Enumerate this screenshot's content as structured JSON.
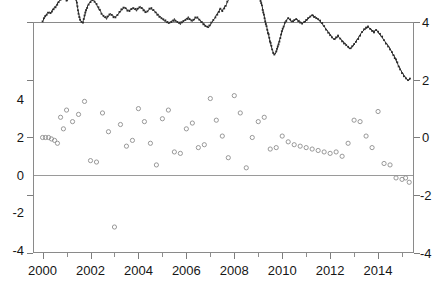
{
  "title": "",
  "chart_data": {
    "type": "line",
    "title": "",
    "xlabel": "",
    "ylabel_left": "",
    "ylabel_right": "",
    "xlim": [
      1999.6,
      2015.5
    ],
    "ylim_left": [
      -4,
      4
    ],
    "ylim_right": [
      -4,
      4
    ],
    "xticks": [
      2000,
      2002,
      2004,
      2006,
      2008,
      2010,
      2012,
      2014
    ],
    "xticklabels": [
      "2000",
      "2002",
      "2004",
      "2006",
      "2008",
      "2010",
      "2012",
      "2014"
    ],
    "xticks_minor": [
      2001,
      2003,
      2005,
      2007,
      2009,
      2011,
      2013,
      2015
    ],
    "yticks_left": [
      -4,
      -2,
      0,
      2,
      4
    ],
    "yticklabels_left": [
      "-4",
      "-2",
      "0",
      "2",
      "4"
    ],
    "yticks_right": [
      -4,
      -2,
      0,
      2,
      4
    ],
    "yticklabels_right": [
      "-4",
      "-2",
      "0",
      "2",
      "4"
    ],
    "right_axis_offset": 4,
    "grid": false,
    "legend": "none",
    "reference_line_y": 0,
    "series": [
      {
        "name": "index-line",
        "axis": "right",
        "style": "dense-dotted-line",
        "color": "#2b2b2b",
        "x": [
          2000.0,
          2000.08,
          2000.17,
          2000.25,
          2000.33,
          2000.42,
          2000.5,
          2000.58,
          2000.67,
          2000.75,
          2000.83,
          2000.92,
          2001.0,
          2001.08,
          2001.17,
          2001.25,
          2001.33,
          2001.42,
          2001.5,
          2001.58,
          2001.67,
          2001.75,
          2001.83,
          2001.92,
          2002.0,
          2002.08,
          2002.17,
          2002.25,
          2002.33,
          2002.42,
          2002.5,
          2002.58,
          2002.67,
          2002.75,
          2002.83,
          2002.92,
          2003.0,
          2003.08,
          2003.17,
          2003.25,
          2003.33,
          2003.42,
          2003.5,
          2003.58,
          2003.67,
          2003.75,
          2003.83,
          2003.92,
          2004.0,
          2004.08,
          2004.17,
          2004.25,
          2004.33,
          2004.42,
          2004.5,
          2004.58,
          2004.67,
          2004.75,
          2004.83,
          2004.92,
          2005.0,
          2005.08,
          2005.17,
          2005.25,
          2005.33,
          2005.42,
          2005.5,
          2005.58,
          2005.67,
          2005.75,
          2005.83,
          2005.92,
          2006.0,
          2006.08,
          2006.17,
          2006.25,
          2006.33,
          2006.42,
          2006.5,
          2006.58,
          2006.67,
          2006.75,
          2006.83,
          2006.92,
          2007.0,
          2007.08,
          2007.17,
          2007.25,
          2007.33,
          2007.42,
          2007.5,
          2007.58,
          2007.67,
          2007.75,
          2007.83,
          2007.92,
          2008.0,
          2008.08,
          2008.17,
          2008.25,
          2008.33,
          2008.42,
          2008.5,
          2008.58,
          2008.67,
          2008.75,
          2008.83,
          2008.92,
          2009.0,
          2009.08,
          2009.17,
          2009.25,
          2009.33,
          2009.42,
          2009.5,
          2009.58,
          2009.67,
          2009.75,
          2009.83,
          2009.92,
          2010.0,
          2010.08,
          2010.17,
          2010.25,
          2010.33,
          2010.42,
          2010.5,
          2010.58,
          2010.67,
          2010.75,
          2010.83,
          2010.92,
          2011.0,
          2011.08,
          2011.17,
          2011.25,
          2011.33,
          2011.42,
          2011.5,
          2011.58,
          2011.67,
          2011.75,
          2011.83,
          2011.92,
          2012.0,
          2012.08,
          2012.17,
          2012.25,
          2012.33,
          2012.42,
          2012.5,
          2012.58,
          2012.67,
          2012.75,
          2012.83,
          2012.92,
          2013.0,
          2013.08,
          2013.17,
          2013.25,
          2013.33,
          2013.42,
          2013.5,
          2013.58,
          2013.67,
          2013.75,
          2013.83,
          2013.92,
          2014.0,
          2014.08,
          2014.17,
          2014.25,
          2014.33,
          2014.42,
          2014.5,
          2014.58,
          2014.67,
          2014.75,
          2014.83,
          2014.92,
          2015.0,
          2015.08,
          2015.17,
          2015.25,
          2015.33
        ],
        "values": [
          0.02,
          0.15,
          0.28,
          0.34,
          0.3,
          0.42,
          0.5,
          0.58,
          0.7,
          0.8,
          0.88,
          0.8,
          0.72,
          0.78,
          0.84,
          0.9,
          0.95,
          0.7,
          0.3,
          0.05,
          -0.05,
          0.2,
          0.45,
          0.62,
          0.72,
          0.78,
          0.7,
          0.6,
          0.48,
          0.36,
          0.26,
          0.18,
          0.12,
          0.2,
          0.28,
          0.22,
          0.16,
          0.22,
          0.3,
          0.38,
          0.44,
          0.5,
          0.44,
          0.38,
          0.44,
          0.5,
          0.46,
          0.4,
          0.46,
          0.52,
          0.46,
          0.4,
          0.34,
          0.42,
          0.48,
          0.42,
          0.36,
          0.3,
          0.24,
          0.18,
          0.12,
          0.06,
          0.0,
          -0.06,
          -0.02,
          0.04,
          0.1,
          0.04,
          -0.02,
          -0.06,
          -0.02,
          0.04,
          0.1,
          0.16,
          0.1,
          0.04,
          0.1,
          0.16,
          0.1,
          0.04,
          -0.02,
          -0.08,
          -0.14,
          -0.18,
          -0.1,
          0.0,
          0.1,
          0.22,
          0.34,
          0.46,
          0.4,
          0.5,
          0.62,
          0.74,
          0.86,
          0.8,
          0.92,
          1.04,
          1.16,
          1.3,
          1.46,
          1.62,
          1.78,
          1.92,
          2.0,
          1.86,
          1.66,
          1.4,
          1.1,
          0.8,
          0.5,
          0.2,
          -0.1,
          -0.4,
          -0.7,
          -0.95,
          -1.15,
          -1.05,
          -0.8,
          -0.55,
          -0.3,
          -0.1,
          0.05,
          0.12,
          0.06,
          0.0,
          0.06,
          0.12,
          0.06,
          0.0,
          -0.06,
          -0.02,
          0.04,
          0.12,
          0.2,
          0.26,
          0.2,
          0.14,
          0.08,
          0.02,
          -0.06,
          -0.14,
          -0.24,
          -0.34,
          -0.44,
          -0.54,
          -0.62,
          -0.56,
          -0.48,
          -0.56,
          -0.64,
          -0.72,
          -0.8,
          -0.88,
          -0.94,
          -0.86,
          -0.76,
          -0.66,
          -0.56,
          -0.46,
          -0.36,
          -0.28,
          -0.22,
          -0.16,
          -0.22,
          -0.28,
          -0.34,
          -0.28,
          -0.36,
          -0.44,
          -0.52,
          -0.62,
          -0.72,
          -0.82,
          -0.94,
          -1.06,
          -1.18,
          -1.32,
          -1.48,
          -1.62,
          -1.74,
          -1.86,
          -1.96,
          -2.04,
          -1.96
        ]
      },
      {
        "name": "residual-scatter",
        "axis": "left",
        "style": "open-circles",
        "color": "#8d8d8d",
        "x": [
          2000.0,
          2000.12,
          2000.25,
          2000.37,
          2000.5,
          2000.62,
          2000.75,
          2000.87,
          2001.0,
          2001.25,
          2001.5,
          2001.75,
          2002.0,
          2002.25,
          2002.5,
          2002.75,
          2003.0,
          2003.25,
          2003.5,
          2003.75,
          2004.0,
          2004.25,
          2004.5,
          2004.75,
          2005.0,
          2005.25,
          2005.5,
          2005.75,
          2006.0,
          2006.25,
          2006.5,
          2006.75,
          2007.0,
          2007.25,
          2007.5,
          2007.75,
          2008.0,
          2008.25,
          2008.5,
          2008.75,
          2009.0,
          2009.25,
          2009.5,
          2009.75,
          2010.0,
          2010.25,
          2010.5,
          2010.75,
          2011.0,
          2011.25,
          2011.5,
          2011.75,
          2012.0,
          2012.25,
          2012.5,
          2012.75,
          2013.0,
          2013.25,
          2013.5,
          2013.75,
          2014.0,
          2014.25,
          2014.5,
          2014.75,
          2015.0,
          2015.15,
          2015.3
        ],
        "values": [
          0.0,
          0.0,
          0.0,
          -0.05,
          -0.1,
          -0.2,
          0.7,
          0.3,
          0.95,
          0.55,
          0.8,
          1.25,
          -0.8,
          -0.85,
          0.85,
          0.2,
          -3.1,
          0.45,
          -0.3,
          -0.1,
          1.0,
          0.55,
          -0.2,
          -0.95,
          0.65,
          0.95,
          -0.5,
          -0.55,
          0.3,
          0.5,
          -0.35,
          -0.25,
          1.35,
          0.6,
          0.05,
          -0.7,
          1.45,
          0.85,
          -1.05,
          0.0,
          0.55,
          0.7,
          -0.4,
          -0.35,
          0.05,
          -0.15,
          -0.25,
          -0.3,
          -0.35,
          -0.4,
          -0.45,
          -0.5,
          -0.55,
          -0.5,
          -0.65,
          -0.2,
          0.6,
          0.55,
          0.05,
          -0.35,
          0.9,
          -0.9,
          -0.95,
          -1.4,
          -1.45,
          -1.4,
          -1.55
        ]
      }
    ]
  },
  "axes": {
    "left_ticklabels": [
      "4",
      "2",
      "0",
      "-2",
      "-4"
    ],
    "right_ticklabels": [
      "4",
      "2",
      "0",
      "-2",
      "-4"
    ],
    "x_ticklabels": [
      "2000",
      "2002",
      "2004",
      "2006",
      "2008",
      "2010",
      "2012",
      "2014"
    ]
  }
}
